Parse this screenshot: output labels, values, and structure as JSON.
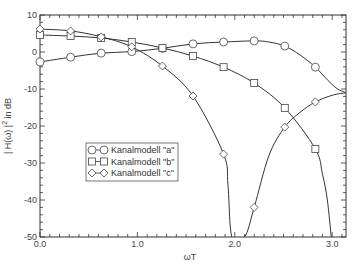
{
  "chart_data": {
    "type": "line",
    "title": "",
    "xlabel": "ωT",
    "ylabel_main": "| H(ω) |",
    "ylabel_sup": "2",
    "ylabel_suffix": " in dB",
    "xlim": [
      0,
      3.1416
    ],
    "ylim": [
      -50,
      10
    ],
    "grid": false,
    "legend_position": "center-left",
    "xticks": [
      0.0,
      1.0,
      2.0,
      3.0
    ],
    "xtick_labels": [
      "0.0",
      "1.0",
      "2.0",
      "3.0"
    ],
    "yticks": [
      10,
      0,
      -10,
      -20,
      -30,
      -40,
      -50
    ],
    "ytick_labels": [
      "10",
      "0",
      "-10",
      "-20",
      "-30",
      "-40",
      "-50"
    ],
    "series": [
      {
        "name": "Kanalmodell \"a\"",
        "marker": "circle",
        "markers_x": [
          0,
          0.314,
          0.628,
          0.942,
          1.257,
          1.571,
          1.885,
          2.199,
          2.513,
          2.827
        ],
        "markers_y": [
          -2.7,
          -1.4,
          -0.3,
          0.1,
          1.0,
          2.2,
          2.7,
          3.0,
          1.6,
          -4.1
        ],
        "x": [
          0,
          0.314,
          0.628,
          0.942,
          1.257,
          1.571,
          1.885,
          2.199,
          2.35,
          2.513,
          2.67,
          2.827,
          2.95,
          3.05,
          3.1416
        ],
        "y": [
          -2.7,
          -1.4,
          -0.3,
          0.1,
          1.0,
          2.2,
          2.7,
          3.0,
          2.7,
          1.6,
          -0.8,
          -4.1,
          -7.5,
          -9.9,
          -11.0
        ]
      },
      {
        "name": "Kanalmodell \"b\"",
        "marker": "square",
        "markers_x": [
          0,
          0.314,
          0.628,
          0.942,
          1.257,
          1.571,
          1.885,
          2.199,
          2.513,
          2.827
        ],
        "markers_y": [
          4.6,
          4.3,
          3.8,
          2.7,
          1.1,
          -1.1,
          -4.1,
          -8.4,
          -15.1,
          -26.2
        ],
        "x": [
          0,
          0.314,
          0.628,
          0.942,
          1.257,
          1.571,
          1.885,
          2.199,
          2.513,
          2.827,
          2.9,
          2.95,
          2.99
        ],
        "y": [
          4.6,
          4.3,
          3.8,
          2.7,
          1.1,
          -1.1,
          -4.1,
          -8.4,
          -15.1,
          -26.2,
          -33,
          -40,
          -50
        ]
      },
      {
        "name": "Kanalmodell \"c\"",
        "marker": "diamond",
        "markers_x": [
          0,
          0.314,
          0.628,
          0.942,
          1.257,
          1.571,
          1.885,
          2.199,
          2.513,
          2.827
        ],
        "markers_y": [
          6.2,
          5.7,
          4.1,
          1.4,
          -3.8,
          -11.9,
          -27.6,
          -42.0,
          -20.3,
          -13.5
        ],
        "x": [
          0,
          0.314,
          0.628,
          0.942,
          1.257,
          1.571,
          1.885,
          1.93,
          1.97,
          2.1,
          2.199,
          2.35,
          2.513,
          2.67,
          2.827,
          3.0,
          3.1416
        ],
        "y": [
          6.2,
          5.7,
          4.1,
          1.4,
          -3.8,
          -11.9,
          -27.6,
          -36,
          -50,
          -50,
          -42.0,
          -28,
          -20.3,
          -16.3,
          -13.5,
          -11.7,
          -11.0
        ]
      }
    ]
  }
}
